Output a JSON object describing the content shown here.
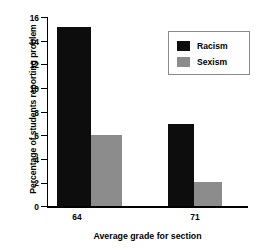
{
  "chart_data": {
    "type": "bar",
    "title": "",
    "xlabel": "Average grade for section",
    "ylabel": "Percentage of students reporting problem",
    "categories": [
      "64",
      "71"
    ],
    "series": [
      {
        "name": "Racism",
        "values": [
          15.2,
          7.0
        ],
        "color": "#0d0d0d"
      },
      {
        "name": "Sexism",
        "values": [
          6.1,
          2.1
        ],
        "color": "#8c8c8c"
      }
    ],
    "ylim": [
      0,
      16
    ],
    "yticks": [
      0,
      2,
      4,
      6,
      8,
      10,
      12,
      14,
      16
    ],
    "ytick_labels": [
      "0",
      "2",
      "4",
      "6",
      "8",
      "10",
      "12",
      "14",
      "16"
    ],
    "grid": false,
    "legend_position": "upper right",
    "legend_entries": [
      "Racism",
      "Sexism"
    ]
  },
  "axes": {
    "y_title": "Percentage of students reporting problem",
    "x_title": "Average grade for section",
    "y_labels": {
      "t0": "0",
      "t1": "2",
      "t2": "4",
      "t3": "6",
      "t4": "8",
      "t5": "10",
      "t6": "12",
      "t7": "14",
      "t8": "16"
    },
    "x_labels": {
      "c0": "64",
      "c1": "71"
    }
  },
  "legend": {
    "items": [
      {
        "label": "Racism"
      },
      {
        "label": "Sexism"
      }
    ]
  }
}
